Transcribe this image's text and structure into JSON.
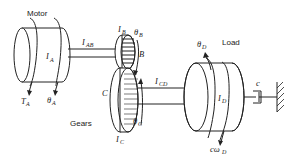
{
  "diagram": {
    "labels": {
      "motor": "Motor",
      "load": "Load",
      "gears": "Gears"
    },
    "symbols": {
      "IA": {
        "main": "I",
        "sub": "A"
      },
      "IAB": {
        "main": "I",
        "sub": "AB"
      },
      "IB": {
        "main": "I",
        "sub": "B"
      },
      "thetaB": {
        "main": "θ",
        "sub": "B"
      },
      "B": {
        "main": "B"
      },
      "C": {
        "main": "C"
      },
      "IC": {
        "main": "I",
        "sub": "C"
      },
      "thetaC": {
        "main": "θ",
        "sub": "C"
      },
      "ICD": {
        "main": "I",
        "sub": "CD"
      },
      "thetaD": {
        "main": "θ",
        "sub": "D"
      },
      "ID": {
        "main": "I",
        "sub": "D"
      },
      "c": {
        "main": "c"
      },
      "cwD": {
        "main": "cω",
        "sub": "D"
      },
      "TA": {
        "main": "T",
        "sub": "A"
      },
      "thetaA": {
        "main": "θ",
        "sub": "A"
      }
    },
    "components": [
      "motor-inertia",
      "shaft-AB",
      "gear-B",
      "gear-C",
      "shaft-CD",
      "load-inertia",
      "damper",
      "ground"
    ]
  }
}
